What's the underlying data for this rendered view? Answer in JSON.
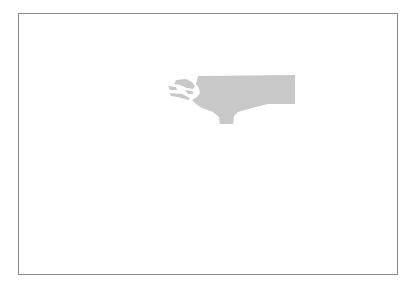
{
  "map": {
    "frame": {
      "border_color": "#8a8a8a",
      "background": "#ffffff"
    },
    "region": {
      "name": "state-shape",
      "fill": "#c8c8c8"
    }
  }
}
